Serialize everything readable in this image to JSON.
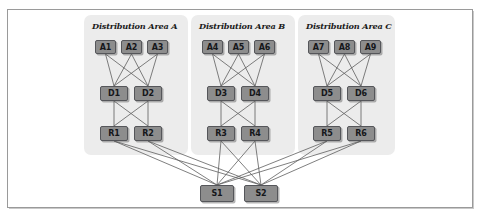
{
  "diagram": {
    "frame": {
      "x": 7,
      "y": 9,
      "w": 466,
      "h": 199,
      "border_color": "#9a9a9a",
      "background": "#ffffff"
    },
    "colors": {
      "panel_fill": "#ececec",
      "node_fill": "#8d8d8d",
      "node_stroke": "#55565a",
      "node_text": "#15171a",
      "wire": "#5e5e5e",
      "label_text": "#1b1b1b"
    },
    "panels": [
      {
        "id": "area-a",
        "label": "Distribution Area A",
        "x": 84,
        "y": 15,
        "w": 104,
        "h": 140,
        "label_x": 92,
        "label_y": 21
      },
      {
        "id": "area-b",
        "label": "Distribution Area B",
        "x": 191,
        "y": 15,
        "w": 104,
        "h": 140,
        "label_x": 199,
        "label_y": 21
      },
      {
        "id": "area-c",
        "label": "Distribution Area C",
        "x": 298,
        "y": 15,
        "w": 97,
        "h": 140,
        "label_x": 306,
        "label_y": 21
      }
    ],
    "nodes": [
      {
        "id": "A1",
        "label": "A1",
        "tier": "access",
        "area": "area-a",
        "x": 95,
        "y": 40,
        "w": 21,
        "h": 14
      },
      {
        "id": "A2",
        "label": "A2",
        "tier": "access",
        "area": "area-a",
        "x": 121,
        "y": 40,
        "w": 21,
        "h": 14
      },
      {
        "id": "A3",
        "label": "A3",
        "tier": "access",
        "area": "area-a",
        "x": 147,
        "y": 40,
        "w": 21,
        "h": 14
      },
      {
        "id": "A4",
        "label": "A4",
        "tier": "access",
        "area": "area-b",
        "x": 202,
        "y": 40,
        "w": 21,
        "h": 14
      },
      {
        "id": "A5",
        "label": "A5",
        "tier": "access",
        "area": "area-b",
        "x": 228,
        "y": 40,
        "w": 21,
        "h": 14
      },
      {
        "id": "A6",
        "label": "A6",
        "tier": "access",
        "area": "area-b",
        "x": 254,
        "y": 40,
        "w": 21,
        "h": 14
      },
      {
        "id": "A7",
        "label": "A7",
        "tier": "access",
        "area": "area-c",
        "x": 308,
        "y": 40,
        "w": 21,
        "h": 14
      },
      {
        "id": "A8",
        "label": "A8",
        "tier": "access",
        "area": "area-c",
        "x": 334,
        "y": 40,
        "w": 21,
        "h": 14
      },
      {
        "id": "A9",
        "label": "A9",
        "tier": "access",
        "area": "area-c",
        "x": 360,
        "y": 40,
        "w": 21,
        "h": 14
      },
      {
        "id": "D1",
        "label": "D1",
        "tier": "distribution",
        "area": "area-a",
        "x": 100,
        "y": 86,
        "w": 28,
        "h": 15
      },
      {
        "id": "D2",
        "label": "D2",
        "tier": "distribution",
        "area": "area-a",
        "x": 134,
        "y": 86,
        "w": 28,
        "h": 15
      },
      {
        "id": "D3",
        "label": "D3",
        "tier": "distribution",
        "area": "area-b",
        "x": 207,
        "y": 86,
        "w": 28,
        "h": 15
      },
      {
        "id": "D4",
        "label": "D4",
        "tier": "distribution",
        "area": "area-b",
        "x": 241,
        "y": 86,
        "w": 28,
        "h": 15
      },
      {
        "id": "D5",
        "label": "D5",
        "tier": "distribution",
        "area": "area-c",
        "x": 313,
        "y": 86,
        "w": 28,
        "h": 15
      },
      {
        "id": "D6",
        "label": "D6",
        "tier": "distribution",
        "area": "area-c",
        "x": 347,
        "y": 86,
        "w": 28,
        "h": 15
      },
      {
        "id": "R1",
        "label": "R1",
        "tier": "router",
        "area": "area-a",
        "x": 100,
        "y": 126,
        "w": 28,
        "h": 15
      },
      {
        "id": "R2",
        "label": "R2",
        "tier": "router",
        "area": "area-a",
        "x": 134,
        "y": 126,
        "w": 28,
        "h": 15
      },
      {
        "id": "R3",
        "label": "R3",
        "tier": "router",
        "area": "area-b",
        "x": 207,
        "y": 126,
        "w": 28,
        "h": 15
      },
      {
        "id": "R4",
        "label": "R4",
        "tier": "router",
        "area": "area-b",
        "x": 241,
        "y": 126,
        "w": 28,
        "h": 15
      },
      {
        "id": "R5",
        "label": "R5",
        "tier": "router",
        "area": "area-c",
        "x": 313,
        "y": 126,
        "w": 28,
        "h": 15
      },
      {
        "id": "R6",
        "label": "R6",
        "tier": "router",
        "area": "area-c",
        "x": 347,
        "y": 126,
        "w": 28,
        "h": 15
      },
      {
        "id": "S1",
        "label": "S1",
        "tier": "core",
        "area": "core",
        "x": 200,
        "y": 185,
        "w": 34,
        "h": 17
      },
      {
        "id": "S2",
        "label": "S2",
        "tier": "core",
        "area": "core",
        "x": 244,
        "y": 185,
        "w": 34,
        "h": 17
      }
    ],
    "links": [
      {
        "from": "A1",
        "to": "D1"
      },
      {
        "from": "A1",
        "to": "D2"
      },
      {
        "from": "A2",
        "to": "D1"
      },
      {
        "from": "A2",
        "to": "D2"
      },
      {
        "from": "A3",
        "to": "D1"
      },
      {
        "from": "A3",
        "to": "D2"
      },
      {
        "from": "A4",
        "to": "D3"
      },
      {
        "from": "A4",
        "to": "D4"
      },
      {
        "from": "A5",
        "to": "D3"
      },
      {
        "from": "A5",
        "to": "D4"
      },
      {
        "from": "A6",
        "to": "D3"
      },
      {
        "from": "A6",
        "to": "D4"
      },
      {
        "from": "A7",
        "to": "D5"
      },
      {
        "from": "A7",
        "to": "D6"
      },
      {
        "from": "A8",
        "to": "D5"
      },
      {
        "from": "A8",
        "to": "D6"
      },
      {
        "from": "A9",
        "to": "D5"
      },
      {
        "from": "A9",
        "to": "D6"
      },
      {
        "from": "D1",
        "to": "R1"
      },
      {
        "from": "D1",
        "to": "R2"
      },
      {
        "from": "D2",
        "to": "R1"
      },
      {
        "from": "D2",
        "to": "R2"
      },
      {
        "from": "D3",
        "to": "R3"
      },
      {
        "from": "D3",
        "to": "R4"
      },
      {
        "from": "D4",
        "to": "R3"
      },
      {
        "from": "D4",
        "to": "R4"
      },
      {
        "from": "D5",
        "to": "R5"
      },
      {
        "from": "D5",
        "to": "R6"
      },
      {
        "from": "D6",
        "to": "R5"
      },
      {
        "from": "D6",
        "to": "R6"
      },
      {
        "from": "R1",
        "to": "S1"
      },
      {
        "from": "R1",
        "to": "S2"
      },
      {
        "from": "R2",
        "to": "S1"
      },
      {
        "from": "R2",
        "to": "S2"
      },
      {
        "from": "R3",
        "to": "S1"
      },
      {
        "from": "R3",
        "to": "S2"
      },
      {
        "from": "R4",
        "to": "S1"
      },
      {
        "from": "R4",
        "to": "S2"
      },
      {
        "from": "R5",
        "to": "S1"
      },
      {
        "from": "R5",
        "to": "S2"
      },
      {
        "from": "R6",
        "to": "S1"
      },
      {
        "from": "R6",
        "to": "S2"
      }
    ]
  }
}
